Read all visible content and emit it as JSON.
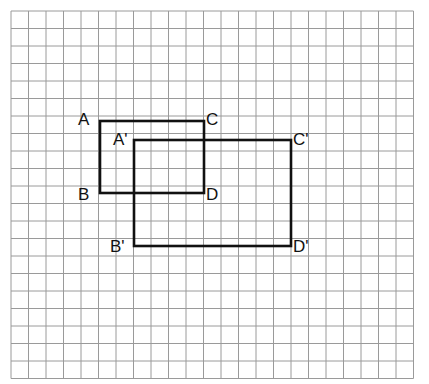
{
  "figure": {
    "background_color": "#ffffff",
    "grid": {
      "line_color": "#9a9a9a",
      "line_width": 1,
      "cell_size": 17.5,
      "origin_x": 11,
      "origin_y": 11,
      "columns": 23,
      "rows": 21,
      "width": 414,
      "height": 368
    },
    "shape_stroke_color": "#111111",
    "shape_stroke_width": 2.6,
    "shapes": [
      {
        "name": "rectangle-abcd",
        "label": "ABCD",
        "x": 100,
        "y": 121,
        "width": 104,
        "height": 72,
        "cells_wide": 6,
        "cells_tall": 4
      },
      {
        "name": "rectangle-a-prime-b-prime-c-prime-d-prime",
        "label": "A'B'C'D'",
        "x": 134,
        "y": 140,
        "width": 157,
        "height": 106,
        "cells_wide": 9,
        "cells_tall": 6
      }
    ],
    "labels": [
      {
        "name": "vertex-label-a",
        "text": "A",
        "x": 78,
        "y": 125,
        "anchor": "start"
      },
      {
        "name": "vertex-label-c",
        "text": "C",
        "x": 206,
        "y": 125,
        "anchor": "start"
      },
      {
        "name": "vertex-label-b",
        "text": "B",
        "x": 78,
        "y": 200,
        "anchor": "start"
      },
      {
        "name": "vertex-label-d",
        "text": "D",
        "x": 206,
        "y": 200,
        "anchor": "start"
      },
      {
        "name": "vertex-label-a-prime",
        "text": "A'",
        "x": 113,
        "y": 145,
        "anchor": "start"
      },
      {
        "name": "vertex-label-c-prime",
        "text": "C'",
        "x": 293,
        "y": 145,
        "anchor": "start"
      },
      {
        "name": "vertex-label-b-prime",
        "text": "B'",
        "x": 110,
        "y": 252,
        "anchor": "start"
      },
      {
        "name": "vertex-label-d-prime",
        "text": "D'",
        "x": 293,
        "y": 252,
        "anchor": "start"
      }
    ]
  }
}
